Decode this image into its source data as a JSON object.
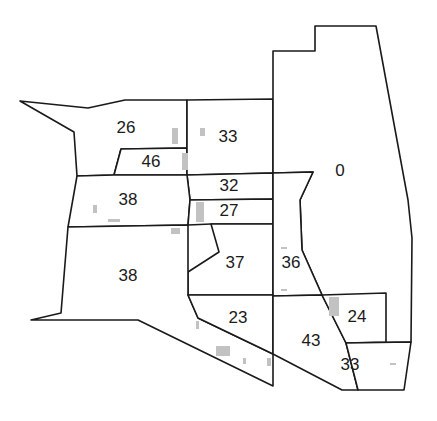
{
  "map": {
    "width": 437,
    "height": 421,
    "stroke_color": "#1a1a1a",
    "building_color": "#c2c2c2",
    "parcels": [
      {
        "id": "p26",
        "label": "26",
        "lx": 126,
        "ly": 129,
        "points": "20,101 88,108 125,100 187,100 187,148 121,149 114,175 77,176 74,132"
      },
      {
        "id": "p46",
        "label": "46",
        "lx": 151,
        "ly": 163,
        "points": "121,149 187,148 187,175 114,175"
      },
      {
        "id": "p33a",
        "label": "33",
        "lx": 228,
        "ly": 138,
        "points": "187,100 273,99 273,173 187,175"
      },
      {
        "id": "p0",
        "label": "0",
        "lx": 340,
        "ly": 172,
        "points": "273,51 315,51 315,26 376,26 408,200 412,238 412,318 411,342 346,343 333,316 300,295 273,296 273,173 313,172 300,200 302,250 333,316 346,343"
      },
      {
        "id": "p32",
        "label": "32",
        "lx": 229,
        "ly": 187,
        "points": "187,175 273,173 273,199 190,200"
      },
      {
        "id": "p38a",
        "label": "38",
        "lx": 128,
        "ly": 201,
        "points": "77,176 114,175 187,175 190,200 188,225 68,227"
      },
      {
        "id": "p27",
        "label": "27",
        "lx": 229,
        "ly": 212,
        "points": "190,200 273,199 273,224 211,224 188,225"
      },
      {
        "id": "p37",
        "label": "37",
        "lx": 235,
        "ly": 264,
        "points": "211,224 273,224 273,295 188,295 188,272 219,252"
      },
      {
        "id": "p38b",
        "label": "38",
        "lx": 128,
        "ly": 277,
        "points": "68,227 188,225 188,295 198,318 273,354 273,386 138,320 31,320 61,313"
      },
      {
        "id": "p36",
        "label": "36",
        "lx": 291,
        "ly": 264,
        "points": "273,173 313,172 300,200 302,250 322,295 273,296"
      },
      {
        "id": "p23",
        "label": "23",
        "lx": 238,
        "ly": 319,
        "points": "188,295 273,295 273,354 198,318"
      },
      {
        "id": "p43",
        "label": "43",
        "lx": 311,
        "ly": 342,
        "points": "273,296 322,295 346,343 358,390 342,390 273,354"
      },
      {
        "id": "p24",
        "label": "24",
        "lx": 357,
        "ly": 318,
        "points": "322,295 386,293 386,342 346,343"
      },
      {
        "id": "p33b",
        "label": "33",
        "lx": 350,
        "ly": 366,
        "points": "346,343 411,342 404,390 358,390"
      }
    ],
    "buildings": [
      {
        "x": 172,
        "y": 128,
        "w": 6,
        "h": 16
      },
      {
        "x": 182,
        "y": 153,
        "w": 6,
        "h": 17
      },
      {
        "x": 200,
        "y": 128,
        "w": 5,
        "h": 8
      },
      {
        "x": 196,
        "y": 202,
        "w": 8,
        "h": 20
      },
      {
        "x": 93,
        "y": 205,
        "w": 4,
        "h": 8
      },
      {
        "x": 108,
        "y": 219,
        "w": 12,
        "h": 3
      },
      {
        "x": 171,
        "y": 228,
        "w": 9,
        "h": 6
      },
      {
        "x": 281,
        "y": 247,
        "w": 6,
        "h": 2
      },
      {
        "x": 281,
        "y": 289,
        "w": 6,
        "h": 2
      },
      {
        "x": 329,
        "y": 297,
        "w": 10,
        "h": 19
      },
      {
        "x": 196,
        "y": 321,
        "w": 3,
        "h": 8
      },
      {
        "x": 216,
        "y": 346,
        "w": 14,
        "h": 10
      },
      {
        "x": 243,
        "y": 358,
        "w": 3,
        "h": 6
      },
      {
        "x": 267,
        "y": 358,
        "w": 4,
        "h": 8
      },
      {
        "x": 390,
        "y": 363,
        "w": 6,
        "h": 2
      }
    ]
  }
}
